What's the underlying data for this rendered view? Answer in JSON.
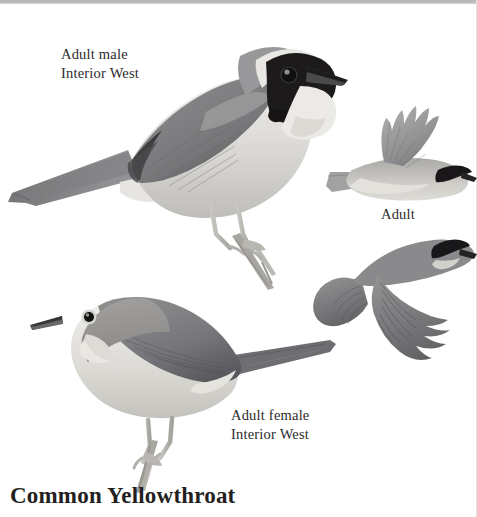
{
  "page": {
    "title": "Common Yellowthroat",
    "background_color": "#ffffff",
    "top_band_color": "#b7b7b9",
    "width": 477,
    "height": 517
  },
  "plate": {
    "subject": "Common Yellowthroat",
    "style": "grayscale field-guide illustration plate",
    "figures": [
      {
        "id": "adult-male-perched",
        "label_line1": "Adult male",
        "label_line2": "Interior West",
        "pose": "perched, facing right, tail to left",
        "features": [
          "black facial mask",
          "pale whitish border above mask",
          "pale throat and breast",
          "medium gray back and wing",
          "dark gray wingtip",
          "long gray tail",
          "pale legs gripping a stem"
        ]
      },
      {
        "id": "adult-flight-upper",
        "label": "Adult",
        "pose": "in flight, facing right, wing raised",
        "features": [
          "black mask",
          "pale underparts",
          "gray upperwing with fanned primaries"
        ]
      },
      {
        "id": "adult-flight-lower",
        "label": "Adult",
        "pose": "in flight, facing right, wing lowered and spread",
        "features": [
          "black mask",
          "darker gray upperparts",
          "broadly fanned primaries"
        ]
      },
      {
        "id": "adult-female-perched",
        "label_line1": "Adult female",
        "label_line2": "Interior West",
        "pose": "perched, facing left, tail to right",
        "features": [
          "no black mask",
          "pale eye-ring",
          "plain gray-brown head and back",
          "pale buffy underparts",
          "long gray tail",
          "pale legs gripping a stem"
        ]
      }
    ],
    "labels": {
      "male_line1": "Adult male",
      "male_line2": "Interior West",
      "female_line1": "Adult female",
      "female_line2": "Interior West",
      "flight_adult": "Adult"
    },
    "colors": {
      "body_gray": "#9b9b9c",
      "back_gray": "#848485",
      "dark_gray": "#636364",
      "wingtip_dark": "#4a4a4b",
      "mask_black": "#1d1b1c",
      "pale": "#e6e4e2",
      "underpart": "#cfcdc9",
      "text": "#2c2a2b",
      "title": "#231f20"
    }
  }
}
